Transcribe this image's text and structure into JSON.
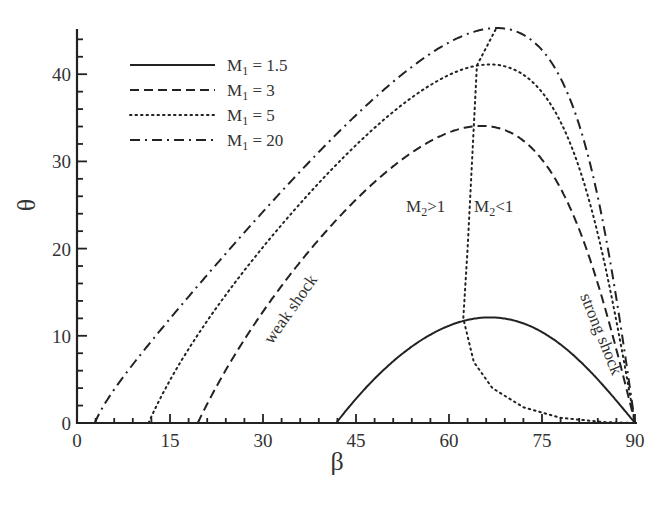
{
  "chart_data": {
    "type": "line",
    "title": "",
    "xlabel": "β",
    "ylabel": "θ",
    "xlim": [
      0,
      90
    ],
    "ylim": [
      0,
      45
    ],
    "xticks": [
      0,
      15,
      30,
      45,
      60,
      75,
      90
    ],
    "yticks": [
      0,
      10,
      20,
      30,
      40
    ],
    "grid": false,
    "legend_position": "upper left",
    "gamma": 1.4,
    "series": [
      {
        "name": "M1 = 1.5",
        "mach": 1.5,
        "style": "solid",
        "x": [
          41.8,
          45,
          50,
          55,
          60,
          66.6,
          75,
          80,
          85,
          90
        ],
        "y": [
          0,
          2.78,
          6.44,
          9.27,
          11.16,
          12.1,
          10.42,
          7.82,
          4.2,
          0
        ]
      },
      {
        "name": "M1 = 3",
        "mach": 3,
        "style": "dashed",
        "x": [
          19.5,
          20,
          30,
          40,
          50,
          60,
          65.2,
          70,
          80,
          85,
          90
        ],
        "y": [
          0,
          0.77,
          12.77,
          21.86,
          28.86,
          33.32,
          34.07,
          33.27,
          23.9,
          13.6,
          0
        ]
      },
      {
        "name": "M1 = 5",
        "mach": 5,
        "style": "dotted",
        "x": [
          11.5,
          12,
          20,
          30,
          40,
          50,
          60,
          65.2,
          70,
          80,
          85,
          90
        ],
        "y": [
          0,
          0.73,
          10.67,
          20.17,
          28.28,
          35.09,
          39.92,
          41.1,
          40.68,
          31.24,
          18.3,
          0
        ]
      },
      {
        "name": "M1 = 20",
        "mach": 20,
        "style": "dash-dot",
        "x": [
          2.9,
          3,
          10,
          20,
          30,
          40,
          50,
          60,
          67.5,
          75,
          80,
          85,
          90
        ],
        "y": [
          0,
          0.22,
          7.62,
          16.16,
          24.23,
          31.8,
          38.53,
          43.64,
          45.1,
          42.77,
          36.24,
          22.3,
          0
        ]
      },
      {
        "name": "sonic line (M2 = 1)",
        "style": "dotted",
        "x": [
          67.5,
          64.5,
          64,
          63.5,
          63,
          62.3,
          64,
          67,
          72,
          78,
          85,
          90
        ],
        "y": [
          45.1,
          41,
          34,
          27,
          20,
          12,
          7,
          4,
          1.8,
          0.6,
          0.1,
          0
        ]
      }
    ],
    "annotations": [
      {
        "text": "weak shock",
        "x": 37,
        "y": 17,
        "rotation": -52
      },
      {
        "text": "strong shock",
        "x": 85,
        "y": 16,
        "rotation": 66
      },
      {
        "text": "M2>1",
        "x": 56.5,
        "y": 30
      },
      {
        "text": "M2<1",
        "x": 66,
        "y": 30
      }
    ]
  },
  "labels": {
    "xlabel": "β",
    "ylabel": "θ",
    "legend": [
      {
        "main": "M",
        "sub": "1",
        "rest": " = 1.5"
      },
      {
        "main": "M",
        "sub": "1",
        "rest": " = 3"
      },
      {
        "main": "M",
        "sub": "1",
        "rest": " = 5"
      },
      {
        "main": "M",
        "sub": "1",
        "rest": " = 20"
      }
    ],
    "weak": "weak shock",
    "strong": "strong shock",
    "m2gt": {
      "main": "M",
      "sub": "2",
      "rest": ">1"
    },
    "m2lt": {
      "main": "M",
      "sub": "2",
      "rest": "<1"
    }
  }
}
